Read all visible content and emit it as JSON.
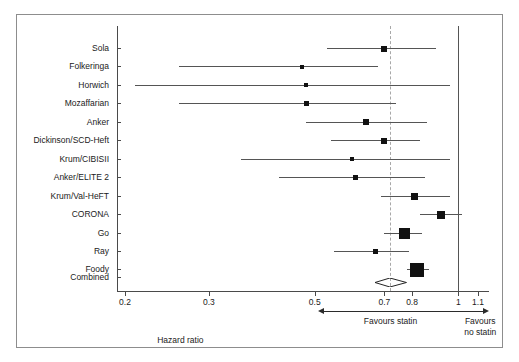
{
  "chart_data": {
    "type": "forest",
    "title": "",
    "xlabel": "Hazard ratio",
    "ylabel": "",
    "scale": "log",
    "xlim": [
      0.19,
      1.16
    ],
    "grid": false,
    "tick_values": [
      0.2,
      0.3,
      0.5,
      0.7,
      0.8,
      1,
      1.1
    ],
    "tick_labels": [
      "0.2",
      "0.3",
      "0.5",
      "0.7",
      "0.8",
      "1",
      "1.1"
    ],
    "reference_line_solid": 1.0,
    "reference_line_dashed": 0.72,
    "categories": [
      "Sola",
      "Folkeringa",
      "Horwich",
      "Mozaffarian",
      "Anker",
      "Dickinson/SCD-Heft",
      "Krum/CIBISII",
      "Anker/ELITE 2",
      "Krum/Val-HeFT",
      "CORONA",
      "Go",
      "Ray",
      "Foody"
    ],
    "studies": [
      {
        "label": "Sola",
        "hr": 0.7,
        "ci_low": 0.53,
        "ci_high": 0.9,
        "weight": 3
      },
      {
        "label": "Folkeringa",
        "hr": 0.47,
        "ci_low": 0.26,
        "ci_high": 0.68,
        "weight": 1.5
      },
      {
        "label": "Horwich",
        "hr": 0.48,
        "ci_low": 0.21,
        "ci_high": 0.96,
        "weight": 1
      },
      {
        "label": "Mozaffarian",
        "hr": 0.48,
        "ci_low": 0.26,
        "ci_high": 0.74,
        "weight": 2
      },
      {
        "label": "Anker",
        "hr": 0.64,
        "ci_low": 0.48,
        "ci_high": 0.86,
        "weight": 3
      },
      {
        "label": "Dickinson/SCD-Heft",
        "hr": 0.7,
        "ci_low": 0.54,
        "ci_high": 0.83,
        "weight": 3.5
      },
      {
        "label": "Krum/CIBISII",
        "hr": 0.6,
        "ci_low": 0.35,
        "ci_high": 0.96,
        "weight": 1.5
      },
      {
        "label": "Anker/ELITE 2",
        "hr": 0.61,
        "ci_low": 0.42,
        "ci_high": 0.85,
        "weight": 2
      },
      {
        "label": "Krum/Val-HeFT",
        "hr": 0.81,
        "ci_low": 0.69,
        "ci_high": 0.96,
        "weight": 4
      },
      {
        "label": "CORONA",
        "hr": 0.92,
        "ci_low": 0.83,
        "ci_high": 1.02,
        "weight": 5
      },
      {
        "label": "Go",
        "hr": 0.77,
        "ci_low": 0.7,
        "ci_high": 0.84,
        "weight": 8
      },
      {
        "label": "Ray",
        "hr": 0.67,
        "ci_low": 0.55,
        "ci_high": 0.79,
        "weight": 2.5
      },
      {
        "label": "Foody",
        "hr": 0.82,
        "ci_low": 0.78,
        "ci_high": 0.87,
        "weight": 11
      }
    ],
    "combined": {
      "label": "Combined",
      "hr": 0.72,
      "ci_low": 0.67,
      "ci_high": 0.78
    }
  },
  "axis": {
    "title": "Hazard ratio",
    "favours_left": "Favours statin",
    "favours_right_line1": "Favours",
    "favours_right_line2": "no statin"
  }
}
